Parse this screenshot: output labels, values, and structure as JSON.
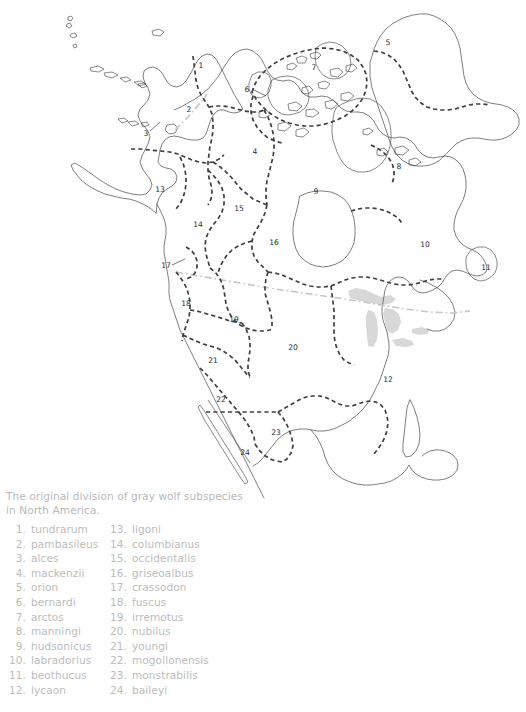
{
  "figure": {
    "caption_lines": [
      "The original division of gray wolf subspecies",
      "in North America."
    ],
    "colors": {
      "text": "#bcbcbc",
      "coastline": "#3a3a3a",
      "subdivision_boundary": "#3f3f3f",
      "reference_border": "#c6c6c6",
      "lake_fill": "#d8d8d8",
      "background": "#ffffff"
    }
  },
  "legend": {
    "left_column": [
      {
        "num": "1.",
        "name": "tundrarum"
      },
      {
        "num": "2.",
        "name": "pambasileus"
      },
      {
        "num": "3.",
        "name": "alces"
      },
      {
        "num": "4.",
        "name": "mackenzii"
      },
      {
        "num": "5.",
        "name": "orion"
      },
      {
        "num": "6.",
        "name": "bernardi"
      },
      {
        "num": "7.",
        "name": "arctos"
      },
      {
        "num": "8.",
        "name": "manningi"
      },
      {
        "num": "9.",
        "name": "hudsonicus"
      },
      {
        "num": "10.",
        "name": "labradorius"
      },
      {
        "num": "11.",
        "name": "beothucus"
      },
      {
        "num": "12.",
        "name": "lycaon"
      }
    ],
    "right_column": [
      {
        "num": "13.",
        "name": "ligoni"
      },
      {
        "num": "14.",
        "name": "columbianus"
      },
      {
        "num": "15.",
        "name": "occidentalis"
      },
      {
        "num": "16.",
        "name": "griseoalbus"
      },
      {
        "num": "17.",
        "name": "crassodon"
      },
      {
        "num": "18.",
        "name": "fuscus"
      },
      {
        "num": "19.",
        "name": "irremotus"
      },
      {
        "num": "20.",
        "name": "nubilus"
      },
      {
        "num": "21.",
        "name": "youngi"
      },
      {
        "num": "22.",
        "name": "mogollonensis"
      },
      {
        "num": "23.",
        "name": "monstrabilis"
      },
      {
        "num": "24.",
        "name": "baileyi"
      }
    ]
  },
  "map_labels": [
    {
      "id": "1",
      "text": "1",
      "x": 201,
      "y": 66
    },
    {
      "id": "2",
      "text": "2",
      "x": 189,
      "y": 110
    },
    {
      "id": "3",
      "text": "3",
      "x": 146,
      "y": 134
    },
    {
      "id": "4",
      "text": "4",
      "x": 255,
      "y": 152
    },
    {
      "id": "5",
      "text": "5",
      "x": 388,
      "y": 43
    },
    {
      "id": "6",
      "text": "6",
      "x": 247,
      "y": 90
    },
    {
      "id": "7",
      "text": "7",
      "x": 314,
      "y": 68
    },
    {
      "id": "8",
      "text": "8",
      "x": 399,
      "y": 167
    },
    {
      "id": "9",
      "text": "9",
      "x": 316,
      "y": 192
    },
    {
      "id": "10",
      "text": "10",
      "x": 425,
      "y": 245
    },
    {
      "id": "11",
      "text": "11",
      "x": 486,
      "y": 268
    },
    {
      "id": "12",
      "text": "12",
      "x": 388,
      "y": 380
    },
    {
      "id": "13",
      "text": "13",
      "x": 160,
      "y": 190
    },
    {
      "id": "14",
      "text": "14",
      "x": 198,
      "y": 225
    },
    {
      "id": "15",
      "text": "15",
      "x": 239,
      "y": 209
    },
    {
      "id": "16",
      "text": "16",
      "x": 274,
      "y": 243
    },
    {
      "id": "17",
      "text": "17",
      "x": 166,
      "y": 266
    },
    {
      "id": "18",
      "text": "18",
      "x": 186,
      "y": 304
    },
    {
      "id": "19",
      "text": "19",
      "x": 234,
      "y": 320
    },
    {
      "id": "20",
      "text": "20",
      "x": 293,
      "y": 348
    },
    {
      "id": "21",
      "text": "21",
      "x": 213,
      "y": 361
    },
    {
      "id": "22",
      "text": "22",
      "x": 221,
      "y": 400
    },
    {
      "id": "23",
      "text": "23",
      "x": 276,
      "y": 433
    },
    {
      "id": "24",
      "text": "24",
      "x": 245,
      "y": 453
    }
  ],
  "map_meta": {
    "title_semantic": "north-america-gray-wolf-subspecies-map",
    "region_count": 24,
    "projection_note": "North America incl. Greenland, Alaska, Mexico"
  }
}
